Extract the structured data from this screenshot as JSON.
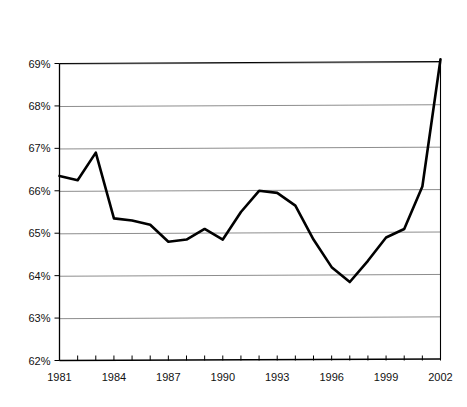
{
  "chart_data": {
    "type": "line",
    "title": "Retail Sales as a Share of Taxable Sales",
    "subtitle": "California",
    "xlabel": "",
    "ylabel": "",
    "ylim": [
      62,
      69
    ],
    "xlim": [
      1981,
      2002
    ],
    "grid": true,
    "legend": false,
    "y_tick_labels": [
      "69%",
      "68%",
      "67%",
      "66%",
      "65%",
      "64%",
      "63%",
      "62%"
    ],
    "y_tick_values": [
      69,
      68,
      67,
      66,
      65,
      64,
      63,
      62
    ],
    "x_tick_labels": [
      "1981",
      "1984",
      "1987",
      "1990",
      "1993",
      "1996",
      "1999",
      "2002"
    ],
    "x_tick_values": [
      1981,
      1984,
      1987,
      1990,
      1993,
      1996,
      1999,
      2002
    ],
    "x_minor_ticks": [
      1981,
      1982,
      1983,
      1984,
      1985,
      1986,
      1987,
      1988,
      1989,
      1990,
      1991,
      1992,
      1993,
      1994,
      1995,
      1996,
      1997,
      1998,
      1999,
      2000,
      2001,
      2002
    ],
    "series": [
      {
        "name": "Retail Sales as a Share of Taxable Sales",
        "color": "#000000",
        "x": [
          1981,
          1982,
          1983,
          1984,
          1985,
          1986,
          1987,
          1988,
          1989,
          1990,
          1991,
          1992,
          1993,
          1994,
          1995,
          1996,
          1997,
          1998,
          1999,
          2000,
          2001,
          2002
        ],
        "values": [
          66.35,
          66.25,
          66.9,
          65.35,
          65.3,
          65.2,
          64.8,
          64.85,
          65.1,
          64.85,
          65.5,
          66.0,
          65.95,
          65.65,
          64.85,
          64.2,
          63.85,
          64.35,
          64.9,
          65.1,
          66.1,
          69.1
        ]
      }
    ]
  },
  "colors": {
    "line": "#000000",
    "grid": "#808080",
    "axis": "#000000",
    "background": "#ffffff",
    "text": "#1a1a1a"
  }
}
